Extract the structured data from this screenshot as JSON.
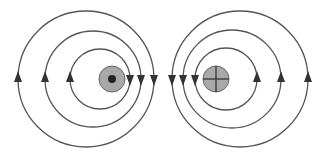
{
  "diagram": {
    "colors": {
      "field_line": "#555555",
      "arrow": "#333333",
      "wire_fill": "#a8a8a8",
      "wire_stroke": "#666666",
      "symbol": "#222222",
      "background": "#ffffff"
    },
    "left": {
      "current_direction": "out of page (dot)",
      "field_direction": "counterclockwise",
      "wire": {
        "cx": 112,
        "cy": 79,
        "r": 13
      },
      "field_lines": [
        {
          "cx": 100,
          "cy": 79,
          "r": 30
        },
        {
          "cx": 93,
          "cy": 79,
          "r": 48
        },
        {
          "cx": 86,
          "cy": 79,
          "r": 68
        }
      ]
    },
    "right": {
      "current_direction": "into page (cross)",
      "field_direction": "clockwise",
      "wire": {
        "cx": 216,
        "cy": 79,
        "r": 13
      },
      "field_lines": [
        {
          "cx": 226,
          "cy": 79,
          "r": 31
        },
        {
          "cx": 232,
          "cy": 79,
          "r": 49
        },
        {
          "cx": 240,
          "cy": 79,
          "r": 68
        }
      ]
    }
  }
}
